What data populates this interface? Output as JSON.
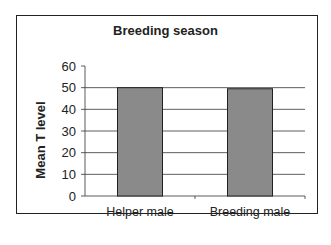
{
  "chart_data": {
    "type": "bar",
    "title": "Breeding season",
    "xlabel": "",
    "ylabel": "Mean T level",
    "categories": [
      "Helper male",
      "Breeding male"
    ],
    "values": [
      50,
      49.5
    ],
    "ylim": [
      0,
      60
    ],
    "yticks": [
      0,
      10,
      20,
      30,
      40,
      50,
      60
    ],
    "grid": true,
    "legend": null,
    "bar_color": "#8a8a8a"
  }
}
